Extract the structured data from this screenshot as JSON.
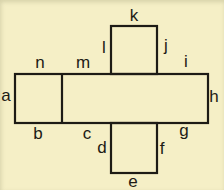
{
  "colors": {
    "background": "#f5efc6",
    "line": "#1d1b15",
    "text": "#1d1b15"
  },
  "diagram": {
    "type": "cuboid-net",
    "labels": {
      "a": "a",
      "b": "b",
      "c": "c",
      "d": "d",
      "e": "e",
      "f": "f",
      "g": "g",
      "h": "h",
      "i": "i",
      "j": "j",
      "k": "k",
      "l": "l",
      "m": "m",
      "n": "n"
    }
  }
}
